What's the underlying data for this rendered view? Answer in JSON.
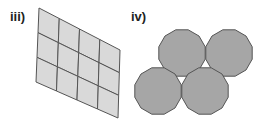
{
  "figures": [
    {
      "label": "iii)",
      "shape": "parallelogram tiling",
      "rows": 3,
      "columns": 4,
      "fill": "#d9d9d9",
      "stroke": "#555555"
    },
    {
      "label": "iv)",
      "shape": "regular dodecagons",
      "count": 4,
      "sides": 12,
      "fill": "#a6a6a6",
      "stroke": "#555555"
    }
  ]
}
